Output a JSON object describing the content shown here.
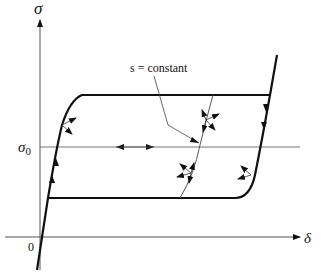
{
  "figure": {
    "y_axis_label": "σ",
    "x_axis_label": "δ",
    "origin_label": "0",
    "reference_level_label": "σ",
    "reference_level_subscript": "0",
    "annotation": "s = constant",
    "colors": {
      "stroke": "#111111",
      "thin_stroke": "#444444",
      "background": "#ffffff"
    }
  }
}
